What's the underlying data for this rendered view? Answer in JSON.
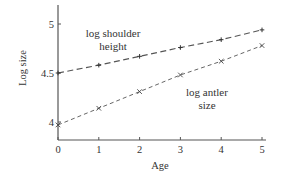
{
  "chart_data": {
    "type": "line",
    "title": "",
    "xlabel": "Age",
    "ylabel": "Log size",
    "x": [
      0,
      1,
      2,
      3,
      4,
      5
    ],
    "xlim": [
      0,
      5
    ],
    "ylim": [
      3.83,
      5.2
    ],
    "xticks": [
      "0",
      "1",
      "2",
      "3",
      "4",
      "5"
    ],
    "yticks": [
      {
        "value": 4,
        "label": "4"
      },
      {
        "value": 4.5,
        "label": "4.5"
      },
      {
        "value": 5,
        "label": "5"
      }
    ],
    "grid": false,
    "legend": "inline annotations",
    "series": [
      {
        "name": "log shoulder height",
        "marker": "+",
        "linestyle": "dashed",
        "values": [
          4.5,
          4.58,
          4.67,
          4.76,
          4.84,
          4.94
        ]
      },
      {
        "name": "log antler size",
        "marker": "x",
        "linestyle": "dashed",
        "values": [
          3.97,
          4.14,
          4.31,
          4.48,
          4.62,
          4.78
        ]
      }
    ],
    "annotations": [
      {
        "text_lines": [
          "log shoulder",
          "height"
        ],
        "series": "log shoulder height"
      },
      {
        "text_lines": [
          "log antler",
          "size"
        ],
        "series": "log antler size"
      }
    ]
  }
}
